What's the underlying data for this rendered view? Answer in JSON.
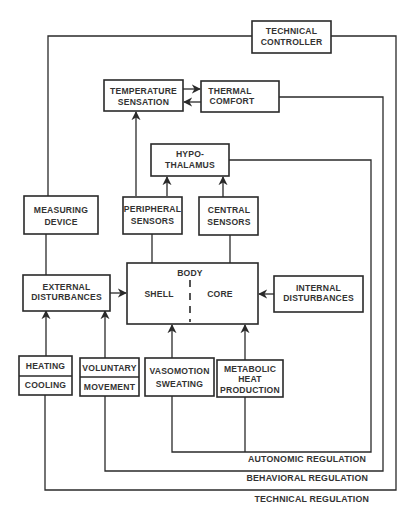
{
  "diagram": {
    "nodes": {
      "technical_controller": {
        "line1": "TECHNICAL",
        "line2": "CONTROLLER"
      },
      "temperature_sensation": {
        "line1": "TEMPERATURE",
        "line2": "SENSATION"
      },
      "thermal_comfort": {
        "line1": "THERMAL",
        "line2": "COMFORT"
      },
      "hypothalamus": {
        "line1": "HYPO-",
        "line2": "THALAMUS"
      },
      "measuring_device": {
        "line1": "MEASURING",
        "line2": "DEVICE"
      },
      "peripheral_sensors": {
        "line1": "PERIPHERAL",
        "line2": "SENSORS"
      },
      "central_sensors": {
        "line1": "CENTRAL",
        "line2": "SENSORS"
      },
      "external_disturbances": {
        "line1": "EXTERNAL",
        "line2": "DISTURBANCES"
      },
      "body": {
        "title": "BODY",
        "shell": "SHELL",
        "core": "CORE"
      },
      "internal_disturbances": {
        "line1": "INTERNAL",
        "line2": "DISTURBANCES"
      },
      "heating_cooling": {
        "top": "HEATING",
        "bottom": "COOLING"
      },
      "voluntary_movement": {
        "top": "VOLUNTARY",
        "bottom": "MOVEMENT"
      },
      "vasomotion_sweating": {
        "line1": "VASOMOTION",
        "line2": "SWEATING"
      },
      "metabolic_heat_production": {
        "line1": "METABOLIC",
        "line2": "HEAT",
        "line3": "PRODUCTION"
      }
    },
    "loops": {
      "autonomic": "AUTONOMIC REGULATION",
      "behavioral": "BEHAVIORAL REGULATION",
      "technical": "TECHNICAL REGULATION"
    },
    "edges": [
      {
        "from": "technical_controller",
        "to": "heating_cooling",
        "via": "technical_regulation"
      },
      {
        "from": "measuring_device",
        "to": "technical_controller"
      },
      {
        "from": "external_disturbances",
        "to": "measuring_device"
      },
      {
        "from": "temperature_sensation",
        "to": "thermal_comfort"
      },
      {
        "from": "thermal_comfort",
        "to": "temperature_sensation"
      },
      {
        "from": "thermal_comfort",
        "to": "voluntary_movement",
        "via": "behavioral_regulation"
      },
      {
        "from": "hypothalamus",
        "to": "vasomotion_sweating",
        "via": "autonomic_regulation"
      },
      {
        "from": "hypothalamus",
        "to": "metabolic_heat_production",
        "via": "autonomic_regulation"
      },
      {
        "from": "peripheral_sensors",
        "to": "temperature_sensation"
      },
      {
        "from": "peripheral_sensors",
        "to": "hypothalamus"
      },
      {
        "from": "central_sensors",
        "to": "hypothalamus"
      },
      {
        "from": "body",
        "to": "peripheral_sensors"
      },
      {
        "from": "body",
        "to": "central_sensors"
      },
      {
        "from": "external_disturbances",
        "to": "body"
      },
      {
        "from": "internal_disturbances",
        "to": "body"
      },
      {
        "from": "heating_cooling",
        "to": "external_disturbances"
      },
      {
        "from": "voluntary_movement",
        "to": "external_disturbances"
      },
      {
        "from": "vasomotion_sweating",
        "to": "body"
      },
      {
        "from": "metabolic_heat_production",
        "to": "body"
      }
    ]
  }
}
